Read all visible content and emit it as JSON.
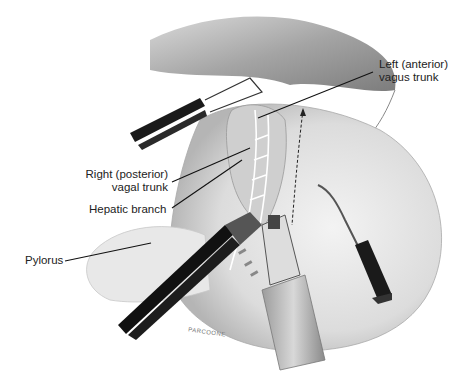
{
  "figure": {
    "type": "surgical illustration",
    "labels": {
      "left_vagus": [
        "Left (anterior)",
        "vagus trunk"
      ],
      "right_vagal": [
        "Right (posterior)",
        "vagal trunk"
      ],
      "hepatic": "Hepatic branch",
      "pylorus": "Pylorus"
    },
    "signature": "PARCOONE",
    "colors": {
      "background": "#ffffff",
      "tissue_dark": "#8a8a8a",
      "tissue_mid": "#bdbdbd",
      "tissue_light": "#e4e4e4",
      "instrument": "#1a1a1a",
      "label_text": "#222222",
      "leader_line": "#111111"
    }
  }
}
